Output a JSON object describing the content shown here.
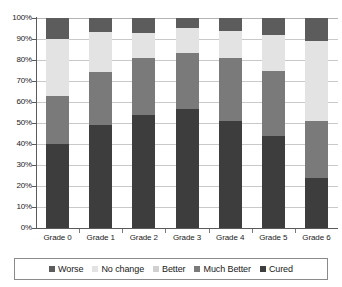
{
  "chart_data": {
    "type": "bar",
    "subtype": "stacked-100-percent",
    "title": "",
    "xlabel": "",
    "ylabel": "",
    "categories": [
      "Grade 0",
      "Grade 1",
      "Grade 2",
      "Grade 3",
      "Grade 4",
      "Grade 5",
      "Grade 6"
    ],
    "series": [
      {
        "name": "Cured",
        "values": [
          40,
          50,
          54,
          57,
          51,
          44,
          24
        ],
        "color": "#3d3d3d"
      },
      {
        "name": "Much Better",
        "values": [
          23,
          26,
          27,
          27,
          30,
          31,
          27
        ],
        "color": "#7a7a7a"
      },
      {
        "name": "Better",
        "values": [
          0,
          0,
          0,
          0,
          0,
          0,
          0
        ],
        "color": "#d0d0d0"
      },
      {
        "name": "No change",
        "values": [
          27,
          19,
          12,
          12,
          13,
          17,
          38
        ],
        "color": "#e3e3e3"
      },
      {
        "name": "Worse",
        "values": [
          10,
          7,
          7,
          5,
          6,
          8,
          11
        ],
        "color": "#5c5c5c"
      }
    ],
    "stack_order_bottom_to_top": [
      "Cured",
      "Much Better",
      "Better",
      "No change",
      "Worse"
    ],
    "ylim": [
      0,
      100
    ],
    "y_ticks": [
      0,
      10,
      20,
      30,
      40,
      50,
      60,
      70,
      80,
      90,
      100
    ],
    "y_tick_labels": [
      "0%",
      "10%",
      "20%",
      "30%",
      "40%",
      "50%",
      "60%",
      "70%",
      "80%",
      "90%",
      "100%"
    ],
    "grid": true,
    "grid_axis": "y",
    "legend_position": "bottom",
    "legend_entries": [
      "Worse",
      "No change",
      "Better",
      "Much Better",
      "Cured"
    ]
  },
  "axis": {
    "y_tick_labels": [
      "100%",
      "90%",
      "80%",
      "70%",
      "60%",
      "50%",
      "40%",
      "30%",
      "20%",
      "10%",
      "0%"
    ],
    "x_tick_labels": [
      "Grade 0",
      "Grade 1",
      "Grade 2",
      "Grade 3",
      "Grade 4",
      "Grade 5",
      "Grade 6"
    ]
  },
  "legend": {
    "items": [
      {
        "label": "Worse",
        "color": "#5c5c5c"
      },
      {
        "label": "No change",
        "color": "#e3e3e3"
      },
      {
        "label": "Better",
        "color": "#d0d0d0"
      },
      {
        "label": "Much Better",
        "color": "#7a7a7a"
      },
      {
        "label": "Cured",
        "color": "#3d3d3d"
      }
    ]
  },
  "colors": {
    "worse": "#5c5c5c",
    "no_change": "#e3e3e3",
    "better": "#d0d0d0",
    "much_better": "#7a7a7a",
    "cured": "#3d3d3d",
    "gridline": "#c9c9c9",
    "axis": "#5a5a5a",
    "background": "#ffffff",
    "text": "#1a1a1a"
  }
}
